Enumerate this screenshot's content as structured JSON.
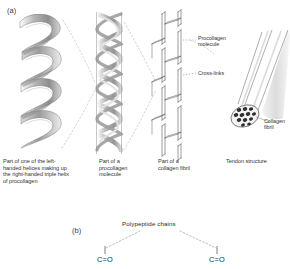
{
  "figure": {
    "panel_a_label": "(a)",
    "panel_b_label": "(b)",
    "background_color": "#ffffff",
    "ink_color": "#333333",
    "ribbon_color": "#a8a8a8",
    "dashed_color": "#b9b9b9"
  },
  "stages": [
    {
      "id": "alpha-helix",
      "caption": "Part of one of the left-handed helices making up the right-handed triple helix of procollagen"
    },
    {
      "id": "procollagen-molecule",
      "caption": "Part of a procollagen molecule"
    },
    {
      "id": "collagen-fibril",
      "caption": "Part of a collagen fibril"
    },
    {
      "id": "tendon-structure",
      "caption": "Tendon structure"
    }
  ],
  "callouts": [
    {
      "id": "procollagen-molecule-callout",
      "text_line1": "Procollagen",
      "text_line2": "molecule"
    },
    {
      "id": "cross-links-callout",
      "text_line1": "Cross-links",
      "text_line2": ""
    },
    {
      "id": "collagen-fibril-callout",
      "text_line1": "Collagen",
      "text_line2": "fibril"
    }
  ],
  "panel_b": {
    "chains_label": "Polypeptide chains",
    "left_group": "C=O",
    "right_group": "C=O"
  }
}
